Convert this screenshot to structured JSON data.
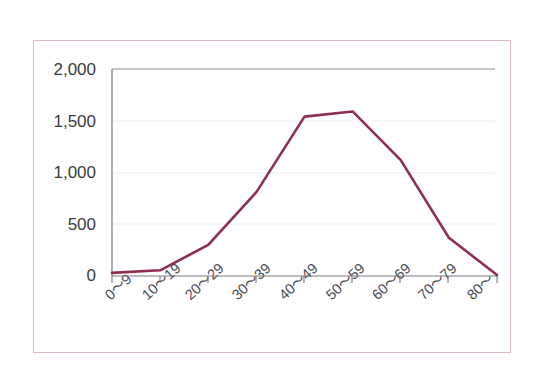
{
  "figure": {
    "frame_color": "#d8bcc4",
    "background": "#ffffff",
    "caption": ""
  },
  "chart_data": {
    "type": "line",
    "title": "",
    "subtitle": "",
    "xlabel": "",
    "ylabel": "",
    "categories": [
      "0〜9",
      "10〜19",
      "20〜29",
      "30〜39",
      "40〜49",
      "50〜59",
      "60〜69",
      "70〜79",
      "80〜"
    ],
    "values": [
      30,
      55,
      300,
      810,
      1540,
      1590,
      1120,
      370,
      10
    ],
    "series": [
      {
        "name": "",
        "color": "#8e2f4b",
        "values": [
          30,
          55,
          300,
          810,
          1540,
          1590,
          1120,
          370,
          10
        ]
      }
    ],
    "ylim": [
      0,
      2000
    ],
    "yticks": [
      0,
      500,
      1000,
      1500,
      2000
    ],
    "ytick_labels": [
      "0",
      "500",
      "1,000",
      "1,500",
      "2,000"
    ],
    "xtick_labels": [
      "0〜9",
      "10〜19",
      "20〜29",
      "30〜39",
      "40〜49",
      "50〜59",
      "60〜69",
      "70〜79",
      "80〜"
    ],
    "grid": true,
    "grid_color": "#e6e6ea",
    "axis_color": "#6f6f75",
    "legend": null,
    "legend_position": "none",
    "line_width": 2.6,
    "markers": false
  },
  "axis": {
    "y_labels": [
      "2,000",
      "1,500",
      "1,000",
      "500",
      "0"
    ],
    "x_labels": [
      "0〜9",
      "10〜19",
      "20〜29",
      "30〜39",
      "40〜49",
      "50〜59",
      "60〜69",
      "70〜79",
      "80〜"
    ]
  }
}
